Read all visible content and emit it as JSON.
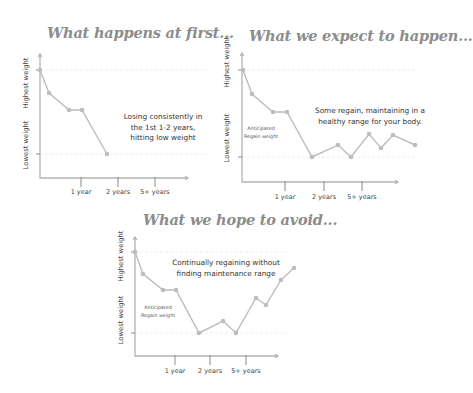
{
  "chart_data": [
    {
      "type": "line",
      "title": "What happens at first...",
      "ylabel_high": "Highest weight",
      "ylabel_low": "Lowest weight",
      "x_ticks": [
        "1 year",
        "2 years",
        "5+ years"
      ],
      "annotation": [
        "Losing consistently in",
        "the 1st 1-2 years,",
        "hitting low weight"
      ],
      "note": [],
      "values": [
        100,
        82,
        68,
        68,
        33
      ],
      "frame": {
        "ax": 40,
        "ay_top": 54,
        "ay_bot": 178,
        "ax_end": 188,
        "hi_y": 70,
        "lo_y": 154,
        "ticks_x": [
          81,
          118,
          155
        ],
        "tick_label_y": 194,
        "ylab_x": 28,
        "ylab_hi_y": 83,
        "ylab_lo_y": 145,
        "ref_end": 207
      },
      "points": [
        [
          40,
          70
        ],
        [
          49,
          93
        ],
        [
          69,
          110
        ],
        [
          82,
          110
        ],
        [
          107,
          154
        ]
      ],
      "ann_pos": {
        "x": 163,
        "y": 119,
        "lh": 10.5
      },
      "title_pos": {
        "left": 47,
        "top": 24
      }
    },
    {
      "type": "line",
      "title": "What we expect to happen...",
      "ylabel_high": "Highest weight",
      "ylabel_low": "Lowest weight",
      "x_ticks": [
        "1 year",
        "2 years",
        "5+ years"
      ],
      "annotation": [
        "Some regain, maintaining in a",
        "healthy range for your body."
      ],
      "note": [
        "Anticipated",
        "Regain weight"
      ],
      "values": [
        100,
        82,
        67,
        67,
        31,
        41,
        31,
        57,
        45,
        55,
        48
      ],
      "frame": {
        "ax": 242,
        "ay_top": 53,
        "ay_bot": 182,
        "ax_end": 398,
        "hi_y": 70,
        "lo_y": 157,
        "ticks_x": [
          285,
          324,
          362
        ],
        "tick_label_y": 199,
        "ylab_x": 229,
        "ylab_hi_y": 62,
        "ylab_lo_y": 138,
        "ref_end": 415
      },
      "points": [
        [
          243,
          70
        ],
        [
          252,
          94
        ],
        [
          273,
          112
        ],
        [
          287,
          112
        ],
        [
          312,
          157
        ],
        [
          338,
          145
        ],
        [
          351,
          157
        ],
        [
          369,
          134
        ],
        [
          381,
          148
        ],
        [
          393,
          135
        ],
        [
          415,
          145
        ]
      ],
      "ann_pos": {
        "x": 370,
        "y": 113,
        "lh": 10.5
      },
      "note_pos": {
        "x": 261,
        "y": 130,
        "lh": 7.5
      },
      "title_pos": {
        "left": 249,
        "top": 27
      }
    },
    {
      "type": "line",
      "title": "What we hope to avoid...",
      "ylabel_high": "Highest weight",
      "ylabel_low": "Lowest weight",
      "x_ticks": [
        "1 year",
        "2 years",
        "5+ years"
      ],
      "annotation": [
        "Continually regaining without",
        "finding maintenance range"
      ],
      "note": [
        "Anticipated",
        "Regain weight"
      ],
      "values": [
        100,
        82,
        67,
        67,
        29,
        38,
        29,
        58,
        52,
        72,
        83
      ],
      "frame": {
        "ax": 135,
        "ay_top": 237,
        "ay_bot": 356,
        "ax_end": 278,
        "hi_y": 252,
        "lo_y": 333,
        "ticks_x": [
          175,
          210,
          246
        ],
        "tick_label_y": 373,
        "ylab_x": 123,
        "ylab_hi_y": 256,
        "ylab_lo_y": 320,
        "ref_end": 287
      },
      "points": [
        [
          135,
          252
        ],
        [
          143,
          274
        ],
        [
          163,
          290
        ],
        [
          176,
          290
        ],
        [
          199,
          333
        ],
        [
          223,
          321
        ],
        [
          236,
          333
        ],
        [
          256,
          298
        ],
        [
          266,
          305
        ],
        [
          281,
          280
        ],
        [
          294,
          268
        ]
      ],
      "ann_pos": {
        "x": 226,
        "y": 265,
        "lh": 10.5
      },
      "note_pos": {
        "x": 158,
        "y": 309,
        "lh": 7.5
      },
      "title_pos": {
        "left": 143,
        "top": 211
      }
    }
  ],
  "colors": {
    "title": "#8c8c8c",
    "line": "#bdbdbd",
    "axis": "#b3b3b3",
    "text": "#333333"
  }
}
